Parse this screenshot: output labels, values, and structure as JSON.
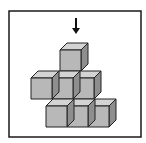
{
  "figure": {
    "frame": {
      "x": 9,
      "y": 11,
      "width": 132,
      "height": 126,
      "stroke": "#1a1a1a"
    },
    "arrow": {
      "x": 76,
      "y_start": 18,
      "y_end": 34,
      "direction": "down",
      "color": "#111111"
    },
    "cube_style": {
      "size": 21,
      "depth_x": 7,
      "depth_y": 7,
      "front_color": "#b8b8b8",
      "top_color": "#d4d4d4",
      "side_color": "#8e8e8e",
      "edge_color": "#222222"
    },
    "rows": [
      {
        "name": "top",
        "front_y": 50,
        "cubes_x": [
          60
        ]
      },
      {
        "name": "middle",
        "front_y": 78,
        "cubes_x": [
          31,
          52,
          73
        ]
      },
      {
        "name": "bottom",
        "front_y": 106,
        "cubes_x": [
          46,
          67,
          88
        ]
      }
    ],
    "cube_count": 7
  }
}
